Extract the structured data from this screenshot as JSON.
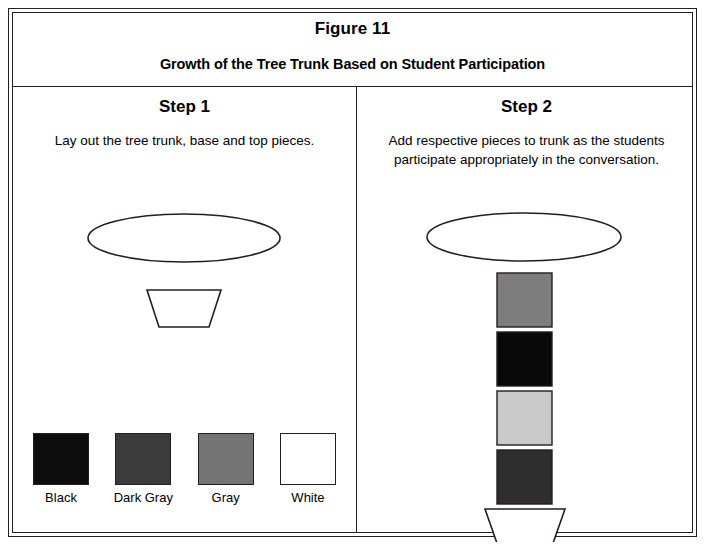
{
  "figure": {
    "title": "Figure 11",
    "subtitle": "Growth of the Tree Trunk Based on Student Participation"
  },
  "steps": [
    {
      "title": "Step 1",
      "description": "Lay out the tree trunk, base and top pieces.",
      "shapes": [
        "top-ellipse",
        "base-trapezoid"
      ]
    },
    {
      "title": "Step 2",
      "description": "Add respective pieces to trunk as the students participate appropriately in the conversation.",
      "shapes": [
        "top-ellipse",
        "trunk-square-gray",
        "trunk-square-black",
        "trunk-square-light-gray",
        "trunk-square-dark-gray",
        "base-trapezoid"
      ]
    }
  ],
  "legend": {
    "items": [
      {
        "label": "Black",
        "color": "#0d0d0d"
      },
      {
        "label": "Dark Gray",
        "color": "#3b3b3b"
      },
      {
        "label": "Gray",
        "color": "#737373"
      },
      {
        "label": "White",
        "color": "#ffffff"
      }
    ]
  },
  "trunk_stack": {
    "squares": [
      {
        "name": "gray",
        "color": "#7d7d7d"
      },
      {
        "name": "black",
        "color": "#090909"
      },
      {
        "name": "light-gray",
        "color": "#c9c9c9"
      },
      {
        "name": "dark-gray",
        "color": "#2e2e2e"
      }
    ]
  },
  "colors": {
    "stroke": "#231f20",
    "background": "#ffffff"
  }
}
